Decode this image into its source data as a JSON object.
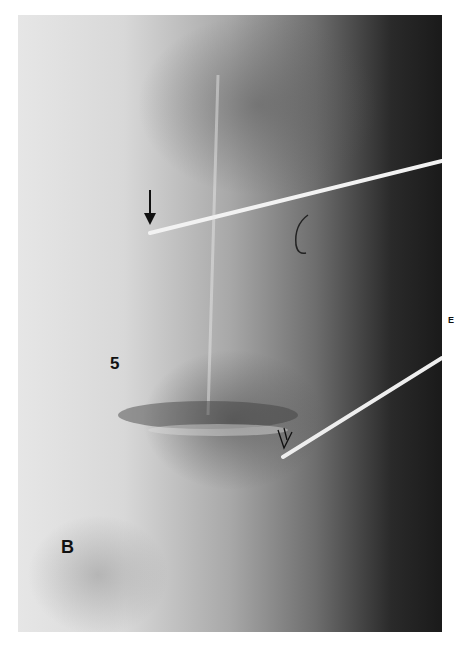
{
  "figure": {
    "type": "radiograph",
    "labels": {
      "vertebra": "5",
      "region": "B",
      "panel": "E"
    },
    "annotations": [
      {
        "name": "straight-arrow",
        "description": "solid down arrow pointing to needle tip"
      },
      {
        "name": "open-curved-arrow",
        "description": "open arrow near lower needle tip at disc"
      }
    ],
    "colors": {
      "background": "#ffffff",
      "bone_light": "#e6e6e6",
      "soft_tissue_dark": "#1a1a1a",
      "needle": "#f0f0f0",
      "label": "#111111"
    }
  }
}
